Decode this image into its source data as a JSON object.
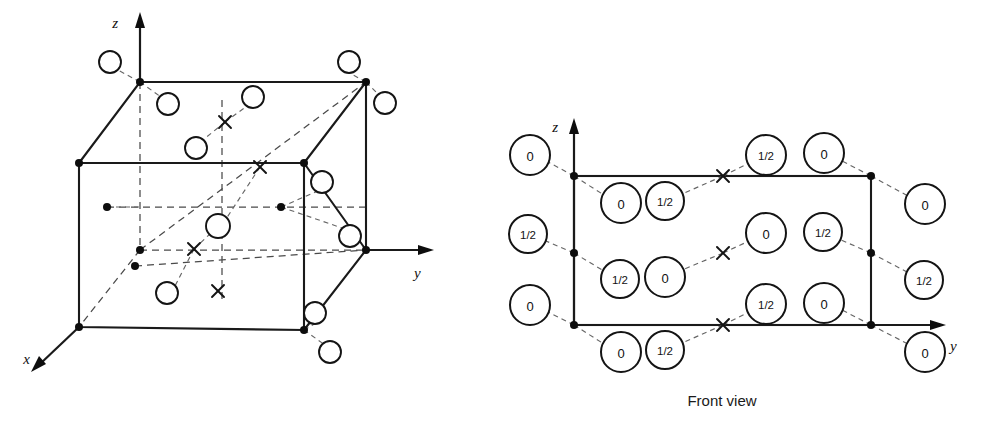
{
  "figure": {
    "caption": "Front view",
    "panels": [
      {
        "id": "unit-cell-3d",
        "name": "three-dimensional unit cell",
        "axes": [
          {
            "label": "x",
            "name": "x-axis"
          },
          {
            "label": "y",
            "name": "y-axis"
          },
          {
            "label": "z",
            "name": "z-axis"
          }
        ],
        "cube": {
          "front_top_left": [
            79,
            163
          ],
          "front_top_right": [
            304,
            163
          ],
          "front_bottom_left": [
            79,
            327
          ],
          "front_bottom_right": [
            304,
            330
          ],
          "back_top_left": [
            140,
            82
          ],
          "back_top_right": [
            366,
            82
          ],
          "back_bottom_left": [
            140,
            250
          ],
          "back_bottom_right": [
            366,
            250
          ]
        },
        "lattice_points": [
          [
            140,
            82
          ],
          [
            366,
            82
          ],
          [
            79,
            163
          ],
          [
            304,
            163
          ],
          [
            140,
            250
          ],
          [
            366,
            250
          ],
          [
            79,
            327
          ],
          [
            304,
            330
          ],
          [
            107,
            207
          ],
          [
            281,
            207
          ],
          [
            135,
            266
          ]
        ],
        "open_circles": [
          [
            110,
            62
          ],
          [
            168,
            104
          ],
          [
            253,
            97
          ],
          [
            196,
            148
          ],
          [
            349,
            62
          ],
          [
            385,
            103
          ],
          [
            322,
            182
          ],
          [
            350,
            236
          ],
          [
            218,
            226
          ],
          [
            167,
            293
          ],
          [
            315,
            313
          ],
          [
            330,
            352
          ]
        ],
        "x_marks": [
          [
            225,
            122
          ],
          [
            260,
            167
          ],
          [
            194,
            249
          ],
          [
            218,
            291
          ]
        ]
      },
      {
        "id": "front-view",
        "name": "front view projection",
        "axes": [
          {
            "label": "y",
            "name": "y-axis"
          },
          {
            "label": "z",
            "name": "z-axis"
          }
        ],
        "rect": {
          "left": 574,
          "right": 871,
          "top": 176,
          "bottom": 325
        },
        "lattice_points": [
          [
            574,
            176
          ],
          [
            871,
            176
          ],
          [
            574,
            253
          ],
          [
            871,
            253
          ],
          [
            574,
            325
          ],
          [
            871,
            325
          ],
          [
            723,
            176
          ],
          [
            723,
            325
          ],
          [
            723,
            253
          ]
        ],
        "labeled_sites": [
          {
            "value": "0",
            "cx": 530,
            "cy": 155,
            "r": 20,
            "tie": [
              574,
              176
            ]
          },
          {
            "value": "0",
            "cx": 621,
            "cy": 203,
            "r": 20,
            "tie": [
              574,
              176
            ]
          },
          {
            "value": "1/2",
            "cx": 665,
            "cy": 201,
            "r": 19,
            "tie": [
              723,
              176
            ]
          },
          {
            "value": "1/2",
            "cx": 766,
            "cy": 155,
            "r": 20,
            "tie": [
              723,
              176
            ]
          },
          {
            "value": "0",
            "cx": 824,
            "cy": 153,
            "r": 20,
            "tie": [
              871,
              176
            ]
          },
          {
            "value": "0",
            "cx": 925,
            "cy": 204,
            "r": 20,
            "tie": [
              871,
              176
            ]
          },
          {
            "value": "1/2",
            "cx": 528,
            "cy": 234,
            "r": 19,
            "tie": [
              574,
              253
            ]
          },
          {
            "value": "1/2",
            "cx": 620,
            "cy": 279,
            "r": 19,
            "tie": [
              574,
              253
            ]
          },
          {
            "value": "0",
            "cx": 665,
            "cy": 277,
            "r": 20,
            "tie": [
              723,
              253
            ]
          },
          {
            "value": "0",
            "cx": 766,
            "cy": 233,
            "r": 20,
            "tie": [
              723,
              253
            ]
          },
          {
            "value": "1/2",
            "cx": 823,
            "cy": 232,
            "r": 19,
            "tie": [
              871,
              253
            ]
          },
          {
            "value": "1/2",
            "cx": 924,
            "cy": 280,
            "r": 19,
            "tie": [
              871,
              253
            ]
          },
          {
            "value": "0",
            "cx": 530,
            "cy": 305,
            "r": 20,
            "tie": [
              574,
              325
            ]
          },
          {
            "value": "0",
            "cx": 621,
            "cy": 352,
            "r": 20,
            "tie": [
              574,
              325
            ]
          },
          {
            "value": "1/2",
            "cx": 665,
            "cy": 350,
            "r": 19,
            "tie": [
              723,
              325
            ]
          },
          {
            "value": "1/2",
            "cx": 766,
            "cy": 304,
            "r": 20,
            "tie": [
              723,
              325
            ]
          },
          {
            "value": "0",
            "cx": 824,
            "cy": 303,
            "r": 20,
            "tie": [
              871,
              325
            ]
          },
          {
            "value": "0",
            "cx": 925,
            "cy": 352,
            "r": 20,
            "tie": [
              871,
              325
            ]
          }
        ],
        "x_marks": [
          [
            723,
            176
          ],
          [
            723,
            253
          ],
          [
            723,
            325
          ]
        ]
      }
    ]
  },
  "labels": {
    "x": "x",
    "y": "y",
    "z": "z",
    "front_view": "Front view"
  },
  "colors": {
    "ink": "#1a1a1a",
    "hidden": "#4a4a4a",
    "tie": "#666666",
    "paper": "#ffffff"
  }
}
